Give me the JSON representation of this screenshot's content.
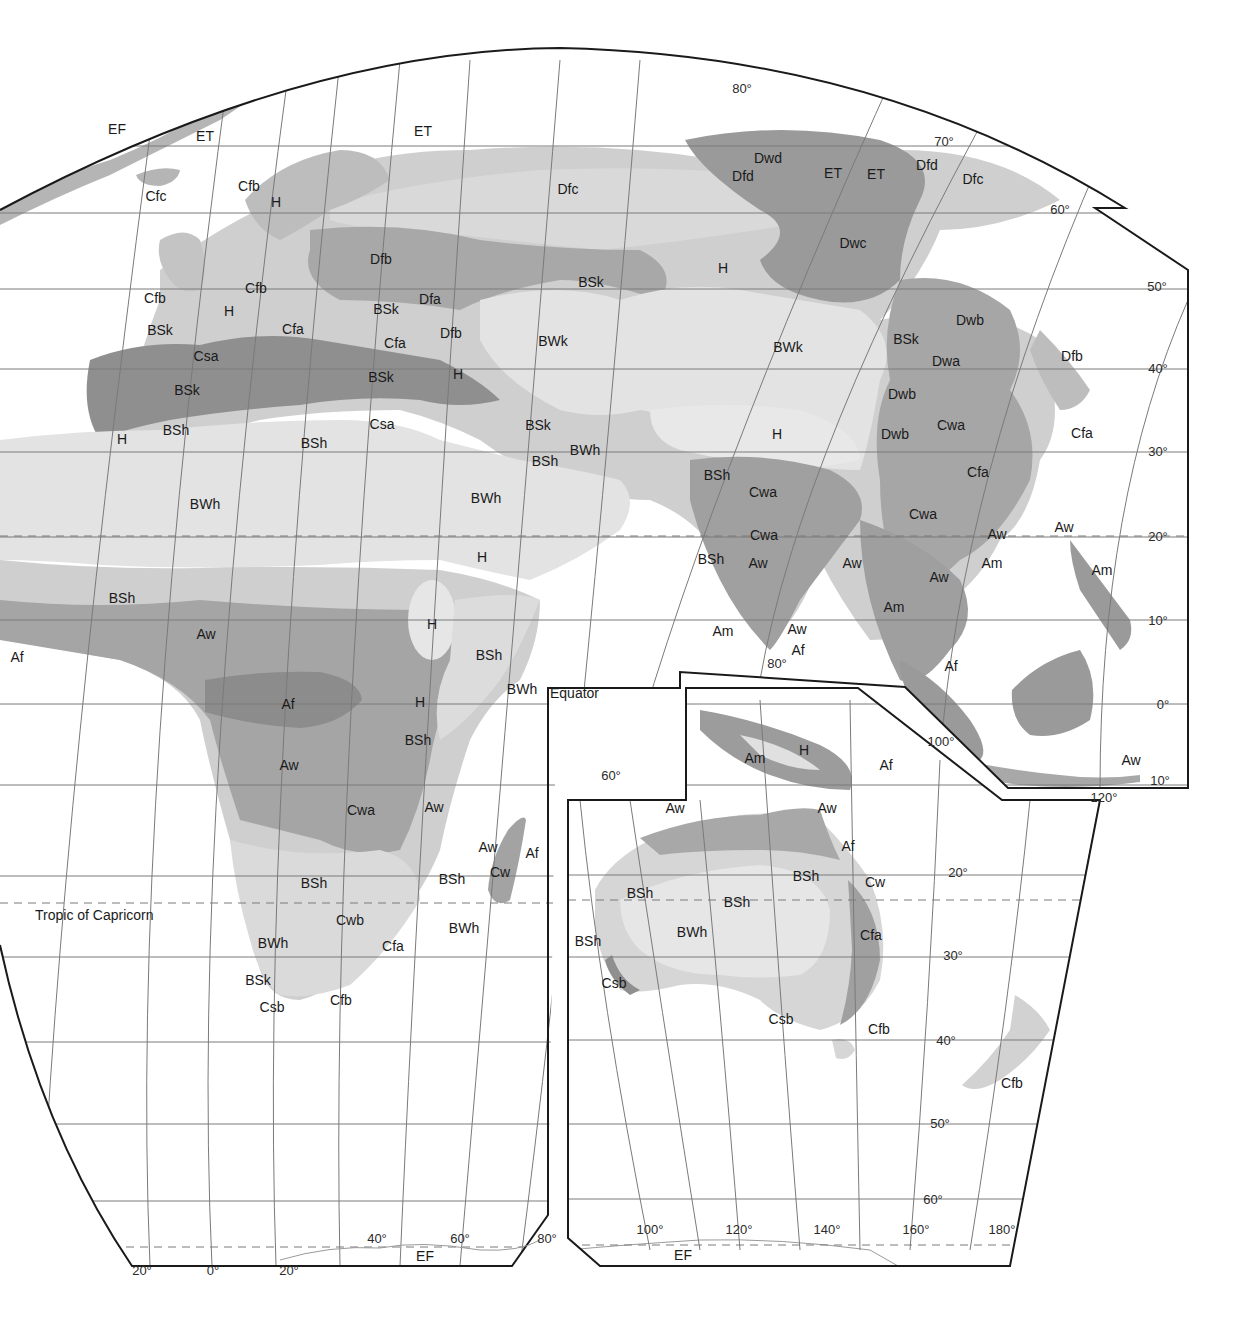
{
  "map": {
    "title": "Köppen climate classification — Eastern Hemisphere (Europe, Asia, Africa, Australia)",
    "colors": {
      "ocean": "#ffffff",
      "very_light": "#e3e3e3",
      "light": "#cfcfcf",
      "medium": "#b3b3b3",
      "dark": "#9a9a9a",
      "darkest": "#8a8a8a",
      "grid": "#7a7a7a",
      "border": "#1a1a1a"
    },
    "reference_lines": {
      "equator": "Equator",
      "tropic_capricorn": "Tropic of Capricorn"
    },
    "latitude_labels": [
      {
        "text": "80°",
        "x": 742,
        "y": 88
      },
      {
        "text": "70°",
        "x": 944,
        "y": 141
      },
      {
        "text": "60°",
        "x": 1060,
        "y": 209
      },
      {
        "text": "50°",
        "x": 1157,
        "y": 286
      },
      {
        "text": "40°",
        "x": 1158,
        "y": 368
      },
      {
        "text": "30°",
        "x": 1158,
        "y": 451
      },
      {
        "text": "20°",
        "x": 1158,
        "y": 536
      },
      {
        "text": "10°",
        "x": 1158,
        "y": 620
      },
      {
        "text": "0°",
        "x": 1163,
        "y": 704
      },
      {
        "text": "10°",
        "x": 1160,
        "y": 780
      },
      {
        "text": "20°",
        "x": 958,
        "y": 872
      },
      {
        "text": "30°",
        "x": 953,
        "y": 955
      },
      {
        "text": "40°",
        "x": 946,
        "y": 1040
      },
      {
        "text": "50°",
        "x": 940,
        "y": 1123
      },
      {
        "text": "60°",
        "x": 933,
        "y": 1199
      }
    ],
    "longitude_labels": [
      {
        "text": "20°",
        "x": 142,
        "y": 1270
      },
      {
        "text": "0°",
        "x": 213,
        "y": 1270
      },
      {
        "text": "20°",
        "x": 289,
        "y": 1270
      },
      {
        "text": "40°",
        "x": 377,
        "y": 1238
      },
      {
        "text": "60°",
        "x": 460,
        "y": 1238
      },
      {
        "text": "80°",
        "x": 547,
        "y": 1238
      },
      {
        "text": "60°",
        "x": 611,
        "y": 775
      },
      {
        "text": "80°",
        "x": 777,
        "y": 663
      },
      {
        "text": "100°",
        "x": 941,
        "y": 741
      },
      {
        "text": "120°",
        "x": 1104,
        "y": 797
      },
      {
        "text": "100°",
        "x": 650,
        "y": 1229
      },
      {
        "text": "120°",
        "x": 739,
        "y": 1229
      },
      {
        "text": "140°",
        "x": 827,
        "y": 1229
      },
      {
        "text": "160°",
        "x": 916,
        "y": 1229
      },
      {
        "text": "180°",
        "x": 1002,
        "y": 1229
      }
    ],
    "climate_labels": [
      {
        "code": "EF",
        "x": 117,
        "y": 129
      },
      {
        "code": "ET",
        "x": 205,
        "y": 136
      },
      {
        "code": "ET",
        "x": 423,
        "y": 131
      },
      {
        "code": "Cfc",
        "x": 156,
        "y": 196
      },
      {
        "code": "Cfb",
        "x": 249,
        "y": 186
      },
      {
        "code": "H",
        "x": 276,
        "y": 202
      },
      {
        "code": "Dfc",
        "x": 568,
        "y": 189
      },
      {
        "code": "Dwd",
        "x": 768,
        "y": 158
      },
      {
        "code": "Dfd",
        "x": 743,
        "y": 176
      },
      {
        "code": "ET",
        "x": 833,
        "y": 173
      },
      {
        "code": "ET",
        "x": 876,
        "y": 174
      },
      {
        "code": "Dfd",
        "x": 927,
        "y": 165
      },
      {
        "code": "Dfc",
        "x": 973,
        "y": 179
      },
      {
        "code": "Dfb",
        "x": 381,
        "y": 259
      },
      {
        "code": "Dwc",
        "x": 853,
        "y": 243
      },
      {
        "code": "H",
        "x": 723,
        "y": 268
      },
      {
        "code": "BSk",
        "x": 591,
        "y": 282
      },
      {
        "code": "Cfb",
        "x": 256,
        "y": 288
      },
      {
        "code": "Cfb",
        "x": 155,
        "y": 298
      },
      {
        "code": "H",
        "x": 229,
        "y": 311
      },
      {
        "code": "BSk",
        "x": 386,
        "y": 309
      },
      {
        "code": "Dfa",
        "x": 430,
        "y": 299
      },
      {
        "code": "Cfa",
        "x": 293,
        "y": 329
      },
      {
        "code": "Dfb",
        "x": 451,
        "y": 333
      },
      {
        "code": "Cfa",
        "x": 395,
        "y": 343
      },
      {
        "code": "BSk",
        "x": 160,
        "y": 330
      },
      {
        "code": "Csa",
        "x": 206,
        "y": 356
      },
      {
        "code": "BSk",
        "x": 381,
        "y": 377
      },
      {
        "code": "H",
        "x": 458,
        "y": 374
      },
      {
        "code": "BSk",
        "x": 187,
        "y": 390
      },
      {
        "code": "BWk",
        "x": 553,
        "y": 341
      },
      {
        "code": "BWk",
        "x": 788,
        "y": 347
      },
      {
        "code": "BSk",
        "x": 906,
        "y": 339
      },
      {
        "code": "Dwb",
        "x": 970,
        "y": 320
      },
      {
        "code": "Dwa",
        "x": 946,
        "y": 361
      },
      {
        "code": "Dfb",
        "x": 1072,
        "y": 356
      },
      {
        "code": "Dwb",
        "x": 902,
        "y": 394
      },
      {
        "code": "Csa",
        "x": 382,
        "y": 424
      },
      {
        "code": "H",
        "x": 122,
        "y": 439
      },
      {
        "code": "BSh",
        "x": 176,
        "y": 430
      },
      {
        "code": "BSh",
        "x": 314,
        "y": 443
      },
      {
        "code": "BSk",
        "x": 538,
        "y": 425
      },
      {
        "code": "BWh",
        "x": 585,
        "y": 450
      },
      {
        "code": "BSh",
        "x": 545,
        "y": 461
      },
      {
        "code": "H",
        "x": 777,
        "y": 434
      },
      {
        "code": "Dwb",
        "x": 895,
        "y": 434
      },
      {
        "code": "Cwa",
        "x": 951,
        "y": 425
      },
      {
        "code": "Cfa",
        "x": 1082,
        "y": 433
      },
      {
        "code": "Cfa",
        "x": 978,
        "y": 472
      },
      {
        "code": "BSh",
        "x": 717,
        "y": 475
      },
      {
        "code": "Cwa",
        "x": 763,
        "y": 492
      },
      {
        "code": "BWh",
        "x": 205,
        "y": 504
      },
      {
        "code": "BWh",
        "x": 486,
        "y": 498
      },
      {
        "code": "Cwa",
        "x": 764,
        "y": 535
      },
      {
        "code": "Cwa",
        "x": 923,
        "y": 514
      },
      {
        "code": "Aw",
        "x": 997,
        "y": 534
      },
      {
        "code": "Aw",
        "x": 1064,
        "y": 527
      },
      {
        "code": "H",
        "x": 482,
        "y": 557
      },
      {
        "code": "BSh",
        "x": 711,
        "y": 559
      },
      {
        "code": "Aw",
        "x": 758,
        "y": 563
      },
      {
        "code": "Aw",
        "x": 852,
        "y": 563
      },
      {
        "code": "Am",
        "x": 992,
        "y": 563
      },
      {
        "code": "Aw",
        "x": 939,
        "y": 577
      },
      {
        "code": "Am",
        "x": 1102,
        "y": 570
      },
      {
        "code": "BSh",
        "x": 122,
        "y": 598
      },
      {
        "code": "Am",
        "x": 894,
        "y": 607
      },
      {
        "code": "Aw",
        "x": 206,
        "y": 634
      },
      {
        "code": "Af",
        "x": 17,
        "y": 657
      },
      {
        "code": "H",
        "x": 432,
        "y": 624
      },
      {
        "code": "BSh",
        "x": 489,
        "y": 655
      },
      {
        "code": "Am",
        "x": 723,
        "y": 631
      },
      {
        "code": "Aw",
        "x": 797,
        "y": 629
      },
      {
        "code": "Af",
        "x": 798,
        "y": 650
      },
      {
        "code": "BWh",
        "x": 522,
        "y": 689
      },
      {
        "code": "Af",
        "x": 288,
        "y": 704
      },
      {
        "code": "H",
        "x": 420,
        "y": 702
      },
      {
        "code": "Af",
        "x": 951,
        "y": 666
      },
      {
        "code": "BSh",
        "x": 418,
        "y": 740
      },
      {
        "code": "H",
        "x": 804,
        "y": 750
      },
      {
        "code": "Am",
        "x": 755,
        "y": 758
      },
      {
        "code": "Af",
        "x": 886,
        "y": 765
      },
      {
        "code": "Aw",
        "x": 1131,
        "y": 760
      },
      {
        "code": "Aw",
        "x": 289,
        "y": 765
      },
      {
        "code": "Cwa",
        "x": 361,
        "y": 810
      },
      {
        "code": "Aw",
        "x": 434,
        "y": 807
      },
      {
        "code": "Aw",
        "x": 675,
        "y": 808
      },
      {
        "code": "Aw",
        "x": 827,
        "y": 808
      },
      {
        "code": "Aw",
        "x": 488,
        "y": 847
      },
      {
        "code": "Af",
        "x": 532,
        "y": 853
      },
      {
        "code": "Cw",
        "x": 500,
        "y": 872
      },
      {
        "code": "Af",
        "x": 848,
        "y": 846
      },
      {
        "code": "BSh",
        "x": 314,
        "y": 883
      },
      {
        "code": "BSh",
        "x": 452,
        "y": 879
      },
      {
        "code": "BSh",
        "x": 806,
        "y": 876
      },
      {
        "code": "Cw",
        "x": 875,
        "y": 882
      },
      {
        "code": "BSh",
        "x": 640,
        "y": 893
      },
      {
        "code": "BSh",
        "x": 737,
        "y": 902
      },
      {
        "code": "Cwb",
        "x": 350,
        "y": 920
      },
      {
        "code": "BWh",
        "x": 464,
        "y": 928
      },
      {
        "code": "BWh",
        "x": 273,
        "y": 943
      },
      {
        "code": "Cfa",
        "x": 393,
        "y": 946
      },
      {
        "code": "BWh",
        "x": 692,
        "y": 932
      },
      {
        "code": "Cfa",
        "x": 871,
        "y": 935
      },
      {
        "code": "BSh",
        "x": 588,
        "y": 941
      },
      {
        "code": "BSk",
        "x": 258,
        "y": 980
      },
      {
        "code": "Csb",
        "x": 272,
        "y": 1007
      },
      {
        "code": "Cfb",
        "x": 341,
        "y": 1000
      },
      {
        "code": "Csb",
        "x": 614,
        "y": 983
      },
      {
        "code": "Csb",
        "x": 781,
        "y": 1019
      },
      {
        "code": "Cfb",
        "x": 879,
        "y": 1029
      },
      {
        "code": "Cfb",
        "x": 1012,
        "y": 1083
      },
      {
        "code": "EF",
        "x": 425,
        "y": 1256
      },
      {
        "code": "EF",
        "x": 683,
        "y": 1255
      }
    ]
  }
}
